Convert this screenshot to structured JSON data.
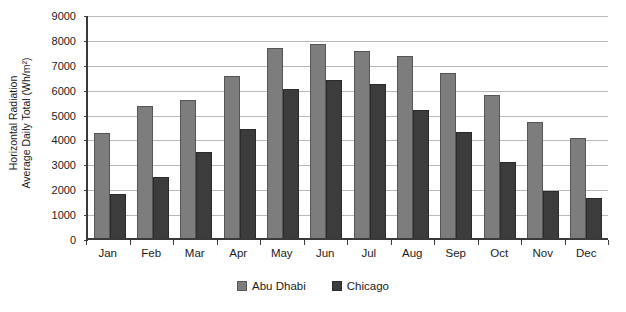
{
  "chart_data": {
    "type": "bar",
    "title": "",
    "xlabel": "",
    "ylabel": "Horizontal Radiation Average Daily Total (Wh/m²)",
    "ylabel_line1": "Horizontal Radiation",
    "ylabel_line2": "Average Daily Total (Wh/m²)",
    "categories": [
      "Jan",
      "Feb",
      "Mar",
      "Apr",
      "May",
      "Jun",
      "Jul",
      "Aug",
      "Sep",
      "Oct",
      "Nov",
      "Dec"
    ],
    "series": [
      {
        "name": "Abu Dhabi",
        "color": "#7d7d7d",
        "values": [
          4200,
          5300,
          5550,
          6500,
          7650,
          7800,
          7500,
          7300,
          6650,
          5750,
          4650,
          4000
        ]
      },
      {
        "name": "Chicago",
        "color": "#3c3c3c",
        "values": [
          1750,
          2450,
          3450,
          4400,
          6000,
          6350,
          6200,
          5150,
          4250,
          3050,
          1900,
          1600
        ]
      }
    ],
    "ylim": [
      0,
      9000
    ],
    "ytick_step": 1000,
    "yticks": [
      0,
      1000,
      2000,
      3000,
      4000,
      5000,
      6000,
      7000,
      8000,
      9000
    ],
    "ytick_labels": [
      "0",
      "1000",
      "2000",
      "3000",
      "4000",
      "5000",
      "6000",
      "7000",
      "8000",
      "9000"
    ],
    "grid": true,
    "legend_position": "bottom"
  }
}
